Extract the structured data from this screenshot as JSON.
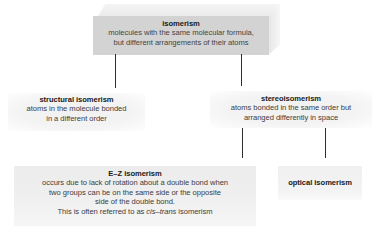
{
  "diagram": {
    "type": "hierarchy",
    "root": {
      "title": "isomerism",
      "desc_line1": "molecules with the same molecular formula,",
      "desc_line2": "but different arrangements of their atoms"
    },
    "structural": {
      "title": "structural isomerism",
      "desc_line1": "atoms in the molecule bonded",
      "desc_line2": "in a different order"
    },
    "stereo": {
      "title": "stereoisomerism",
      "desc_line1": "atoms bonded in the same order but",
      "desc_line2": "arranged differently in space"
    },
    "ez": {
      "title": "E–Z isomerism",
      "desc_line1": "occurs due to lack of rotation about a double bond when",
      "desc_line2": "two groups can be on the same side or the opposite",
      "desc_line3": "side of the double bond.",
      "desc_line4_prefix": "This is often referred to as ",
      "desc_line4_italic": "cis–trans",
      "desc_line4_suffix": " isomerism"
    },
    "optical": {
      "title": "optical isomerism"
    },
    "edges": [
      {
        "from": "isomerism",
        "to": "structural isomerism"
      },
      {
        "from": "isomerism",
        "to": "stereoisomerism"
      },
      {
        "from": "stereoisomerism",
        "to": "E–Z isomerism"
      },
      {
        "from": "stereoisomerism",
        "to": "optical isomerism"
      }
    ]
  }
}
